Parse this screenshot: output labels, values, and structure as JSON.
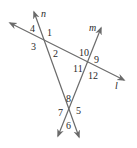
{
  "diagram": {
    "type": "geometry-transversals",
    "colors": {
      "line": "#6a6a6a",
      "text": "#2a2a2a",
      "background": "#ffffff"
    },
    "lines": [
      {
        "name": "l",
        "from": [
          10,
          23
        ],
        "to": [
          124,
          80
        ]
      },
      {
        "name": "n",
        "from": [
          34,
          12
        ],
        "to": [
          79,
          137
        ]
      },
      {
        "name": "m",
        "from": [
          101,
          28
        ],
        "to": [
          58,
          136
        ]
      }
    ],
    "line_labels": {
      "l": "l",
      "n": "n",
      "m": "m"
    },
    "angle_labels": {
      "a1": "1",
      "a2": "2",
      "a3": "3",
      "a4": "4",
      "a5": "5",
      "a6": "6",
      "a7": "7",
      "a8": "8",
      "a9": "9",
      "a10": "10",
      "a11": "11",
      "a12": "12"
    }
  }
}
